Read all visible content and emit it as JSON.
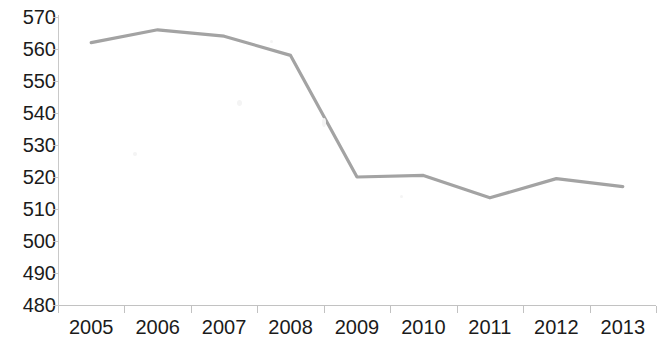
{
  "chart_data": {
    "type": "line",
    "title": "",
    "subtitle": "",
    "xlabel": "",
    "ylabel": "",
    "categories": [
      "2005",
      "2006",
      "2007",
      "2008",
      "2009",
      "2010",
      "2011",
      "2012",
      "2013"
    ],
    "series": [
      {
        "name": "",
        "values": [
          562,
          566,
          564,
          558,
          520,
          520.5,
          513.5,
          519.5,
          517
        ]
      }
    ],
    "ylim": [
      480,
      570
    ],
    "yticks": [
      570,
      560,
      550,
      540,
      530,
      520,
      510,
      500,
      490,
      480
    ],
    "ytick_labels": [
      "570",
      "560",
      "550",
      "540",
      "530",
      "520",
      "510",
      "500",
      "490",
      "480"
    ],
    "grid": false,
    "legend": false,
    "legend_position": "none",
    "markers": false,
    "line_color": "#a3a3a3",
    "axis_color": "#c5c5c5",
    "text_color": "#1b1b1b",
    "background_color": "#ffffff"
  }
}
